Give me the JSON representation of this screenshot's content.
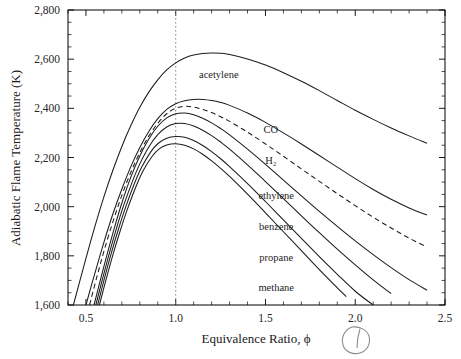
{
  "chart_data": {
    "type": "line",
    "title": "",
    "xlabel": "Equivalence Ratio, ϕ",
    "ylabel": "Adiabatic Flame Temperature (K)",
    "xlim": [
      0.4,
      2.5
    ],
    "ylim": [
      1600,
      2800
    ],
    "grid": false,
    "legend_position": "inline-labels",
    "xticks": [
      0.5,
      1.0,
      1.5,
      2.0,
      2.5
    ],
    "xtick_labels": [
      "0.5",
      "1.0",
      "1.5",
      "2.0",
      "2.5"
    ],
    "xminor_step": 0.1,
    "yticks": [
      1600,
      1800,
      2000,
      2200,
      2400,
      2600,
      2800
    ],
    "ytick_labels": [
      "1,600",
      "1,800",
      "2,000",
      "2,200",
      "2,400",
      "2,600",
      "2,800"
    ],
    "yminor_step": 50,
    "annotations": [
      {
        "name": "stoichiometric-line",
        "type": "vline",
        "x": 1.0,
        "style": "dotted"
      },
      {
        "name": "handwritten-circle-mark",
        "type": "ink",
        "x_px": 358,
        "y_px": 340
      }
    ],
    "series": [
      {
        "name": "acetylene",
        "label": "acetylene",
        "style": "solid",
        "label_x": 1.24,
        "label_y": 2525,
        "points": [
          [
            0.43,
            1600
          ],
          [
            0.5,
            1790
          ],
          [
            0.55,
            1920
          ],
          [
            0.6,
            2040
          ],
          [
            0.65,
            2148
          ],
          [
            0.7,
            2245
          ],
          [
            0.75,
            2330
          ],
          [
            0.8,
            2404
          ],
          [
            0.85,
            2466
          ],
          [
            0.9,
            2516
          ],
          [
            0.95,
            2556
          ],
          [
            1.0,
            2585
          ],
          [
            1.05,
            2605
          ],
          [
            1.1,
            2617
          ],
          [
            1.15,
            2623
          ],
          [
            1.2,
            2625
          ],
          [
            1.25,
            2624
          ],
          [
            1.3,
            2619
          ],
          [
            1.4,
            2601
          ],
          [
            1.5,
            2576
          ],
          [
            1.6,
            2545
          ],
          [
            1.7,
            2510
          ],
          [
            1.8,
            2472
          ],
          [
            1.9,
            2432
          ],
          [
            2.0,
            2392
          ],
          [
            2.1,
            2355
          ],
          [
            2.2,
            2320
          ],
          [
            2.3,
            2288
          ],
          [
            2.4,
            2258
          ]
        ]
      },
      {
        "name": "CO",
        "label": "CO",
        "style": "solid",
        "label_x": 1.53,
        "label_y": 2300,
        "points": [
          [
            0.5,
            1600
          ],
          [
            0.55,
            1730
          ],
          [
            0.6,
            1855
          ],
          [
            0.65,
            1970
          ],
          [
            0.7,
            2072
          ],
          [
            0.75,
            2163
          ],
          [
            0.8,
            2241
          ],
          [
            0.85,
            2306
          ],
          [
            0.9,
            2358
          ],
          [
            0.95,
            2396
          ],
          [
            1.0,
            2419
          ],
          [
            1.05,
            2431
          ],
          [
            1.1,
            2436
          ],
          [
            1.15,
            2436
          ],
          [
            1.2,
            2432
          ],
          [
            1.25,
            2424
          ],
          [
            1.3,
            2412
          ],
          [
            1.4,
            2381
          ],
          [
            1.5,
            2343
          ],
          [
            1.6,
            2300
          ],
          [
            1.7,
            2255
          ],
          [
            1.8,
            2208
          ],
          [
            1.9,
            2161
          ],
          [
            2.0,
            2114
          ],
          [
            2.1,
            2070
          ],
          [
            2.2,
            2030
          ],
          [
            2.3,
            1995
          ],
          [
            2.4,
            1966
          ]
        ]
      },
      {
        "name": "H2",
        "label": "H₂",
        "style": "dashed",
        "label_x": 1.53,
        "label_y": 2175,
        "points": [
          [
            0.52,
            1600
          ],
          [
            0.56,
            1712
          ],
          [
            0.6,
            1818
          ],
          [
            0.65,
            1938
          ],
          [
            0.7,
            2046
          ],
          [
            0.75,
            2140
          ],
          [
            0.8,
            2220
          ],
          [
            0.85,
            2287
          ],
          [
            0.9,
            2339
          ],
          [
            0.95,
            2378
          ],
          [
            1.0,
            2400
          ],
          [
            1.05,
            2408
          ],
          [
            1.1,
            2405
          ],
          [
            1.15,
            2396
          ],
          [
            1.2,
            2383
          ],
          [
            1.25,
            2366
          ],
          [
            1.3,
            2347
          ],
          [
            1.4,
            2303
          ],
          [
            1.5,
            2255
          ],
          [
            1.6,
            2205
          ],
          [
            1.7,
            2154
          ],
          [
            1.8,
            2103
          ],
          [
            1.9,
            2053
          ],
          [
            2.0,
            2004
          ],
          [
            2.1,
            1957
          ],
          [
            2.2,
            1913
          ],
          [
            2.3,
            1872
          ],
          [
            2.4,
            1836
          ]
        ]
      },
      {
        "name": "ethylene",
        "label": "ethylene",
        "style": "solid",
        "label_x": 1.56,
        "label_y": 2030,
        "points": [
          [
            0.545,
            1600
          ],
          [
            0.58,
            1700
          ],
          [
            0.62,
            1812
          ],
          [
            0.66,
            1918
          ],
          [
            0.7,
            2015
          ],
          [
            0.75,
            2120
          ],
          [
            0.8,
            2206
          ],
          [
            0.85,
            2275
          ],
          [
            0.9,
            2327
          ],
          [
            0.95,
            2361
          ],
          [
            1.0,
            2378
          ],
          [
            1.05,
            2381
          ],
          [
            1.1,
            2374
          ],
          [
            1.15,
            2360
          ],
          [
            1.2,
            2341
          ],
          [
            1.25,
            2318
          ],
          [
            1.3,
            2292
          ],
          [
            1.4,
            2234
          ],
          [
            1.5,
            2172
          ],
          [
            1.6,
            2108
          ],
          [
            1.7,
            2044
          ],
          [
            1.8,
            1981
          ],
          [
            1.9,
            1920
          ],
          [
            2.0,
            1861
          ],
          [
            2.1,
            1805
          ],
          [
            2.2,
            1752
          ],
          [
            2.3,
            1703
          ],
          [
            2.4,
            1660
          ]
        ]
      },
      {
        "name": "benzene",
        "label": "benzene",
        "style": "solid",
        "label_x": 1.56,
        "label_y": 1905,
        "points": [
          [
            0.555,
            1600
          ],
          [
            0.59,
            1700
          ],
          [
            0.63,
            1810
          ],
          [
            0.67,
            1912
          ],
          [
            0.71,
            2005
          ],
          [
            0.76,
            2105
          ],
          [
            0.8,
            2174
          ],
          [
            0.85,
            2243
          ],
          [
            0.9,
            2293
          ],
          [
            0.95,
            2324
          ],
          [
            1.0,
            2338
          ],
          [
            1.05,
            2338
          ],
          [
            1.1,
            2328
          ],
          [
            1.15,
            2311
          ],
          [
            1.2,
            2289
          ],
          [
            1.25,
            2263
          ],
          [
            1.3,
            2234
          ],
          [
            1.4,
            2170
          ],
          [
            1.5,
            2102
          ],
          [
            1.6,
            2033
          ],
          [
            1.7,
            1963
          ],
          [
            1.8,
            1894
          ],
          [
            1.9,
            1827
          ],
          [
            2.0,
            1763
          ],
          [
            2.1,
            1702
          ],
          [
            2.2,
            1646
          ]
        ]
      },
      {
        "name": "propane",
        "label": "propane",
        "style": "solid",
        "label_x": 1.56,
        "label_y": 1780,
        "points": [
          [
            0.565,
            1600
          ],
          [
            0.6,
            1700
          ],
          [
            0.64,
            1808
          ],
          [
            0.68,
            1906
          ],
          [
            0.72,
            1996
          ],
          [
            0.77,
            2094
          ],
          [
            0.81,
            2160
          ],
          [
            0.86,
            2222
          ],
          [
            0.9,
            2256
          ],
          [
            0.95,
            2278
          ],
          [
            1.0,
            2285
          ],
          [
            1.05,
            2282
          ],
          [
            1.1,
            2269
          ],
          [
            1.15,
            2249
          ],
          [
            1.2,
            2224
          ],
          [
            1.25,
            2195
          ],
          [
            1.3,
            2163
          ],
          [
            1.4,
            2094
          ],
          [
            1.5,
            2021
          ],
          [
            1.6,
            1946
          ],
          [
            1.7,
            1871
          ],
          [
            1.8,
            1797
          ],
          [
            1.9,
            1725
          ],
          [
            2.0,
            1656
          ],
          [
            2.1,
            1600
          ]
        ]
      },
      {
        "name": "methane",
        "label": "methane",
        "style": "solid",
        "label_x": 1.56,
        "label_y": 1655,
        "points": [
          [
            0.575,
            1600
          ],
          [
            0.61,
            1698
          ],
          [
            0.65,
            1804
          ],
          [
            0.69,
            1900
          ],
          [
            0.73,
            1988
          ],
          [
            0.78,
            2084
          ],
          [
            0.82,
            2148
          ],
          [
            0.87,
            2206
          ],
          [
            0.91,
            2236
          ],
          [
            0.95,
            2251
          ],
          [
            1.0,
            2256
          ],
          [
            1.05,
            2250
          ],
          [
            1.1,
            2235
          ],
          [
            1.15,
            2213
          ],
          [
            1.2,
            2186
          ],
          [
            1.25,
            2156
          ],
          [
            1.3,
            2123
          ],
          [
            1.4,
            2051
          ],
          [
            1.5,
            1975
          ],
          [
            1.6,
            1898
          ],
          [
            1.7,
            1821
          ],
          [
            1.8,
            1744
          ],
          [
            1.9,
            1670
          ],
          [
            1.95,
            1634
          ]
        ]
      }
    ]
  }
}
